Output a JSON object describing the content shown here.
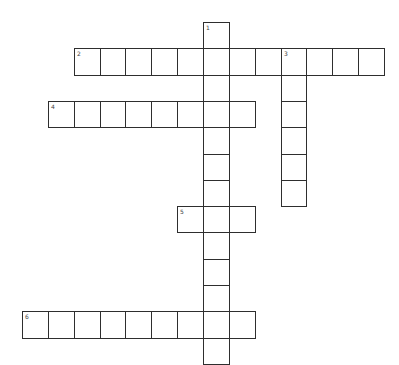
{
  "puzzle": {
    "grid": {
      "origin_x": 22,
      "origin_y": 22,
      "cell_w": 25.86,
      "cell_h": 26.3,
      "border_color": "#2e2e2e",
      "background": "#ffffff"
    },
    "entries": [
      {
        "number": "1",
        "direction": "down",
        "row": 0,
        "col": 7,
        "length": 13
      },
      {
        "number": "2",
        "direction": "across",
        "row": 1,
        "col": 2,
        "length": 12
      },
      {
        "number": "3",
        "direction": "down",
        "row": 1,
        "col": 10,
        "length": 6
      },
      {
        "number": "4",
        "direction": "across",
        "row": 3,
        "col": 1,
        "length": 8
      },
      {
        "number": "5",
        "direction": "across",
        "row": 7,
        "col": 6,
        "length": 3
      },
      {
        "number": "6",
        "direction": "across",
        "row": 11,
        "col": 0,
        "length": 9
      }
    ]
  }
}
